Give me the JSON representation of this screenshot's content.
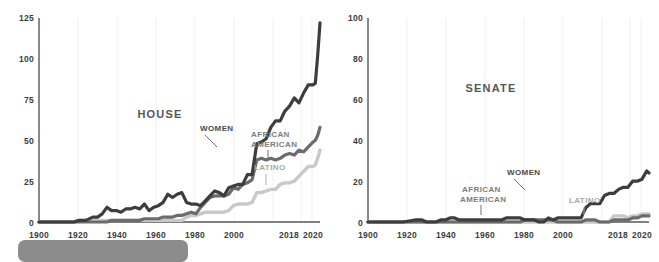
{
  "figure": {
    "background": "#ffffff",
    "caption_bar": {
      "name": "caption-placeholder-bar",
      "color": "#8c8c8c"
    }
  },
  "colors": {
    "women": "#3d3d3d",
    "african_american": "#6b6b6b",
    "latino": "#c9c9c9",
    "axis": "#575757",
    "grid": "#f1f1f1",
    "title": "#565656"
  },
  "chart_data": [
    {
      "type": "line",
      "title": "HOUSE",
      "xlabel": "",
      "ylabel": "",
      "xlim": [
        1900,
        2020
      ],
      "ylim": [
        0,
        125
      ],
      "yticks": [
        0,
        25,
        50,
        75,
        100,
        125
      ],
      "ytick_labels": [
        "0",
        "25",
        "50",
        "75",
        "100",
        "125"
      ],
      "xticks": [
        1900,
        1920,
        1940,
        1960,
        1980,
        2000,
        2018,
        2020
      ],
      "xtick_labels": [
        "1900",
        "1920",
        "1940",
        "1960",
        "1980",
        "2000",
        "2018",
        "2020"
      ],
      "grid": "vertical",
      "legend": "inline-annotations",
      "x": [
        1900,
        1905,
        1910,
        1915,
        1917,
        1920,
        1923,
        1925,
        1927,
        1929,
        1931,
        1933,
        1935,
        1937,
        1939,
        1941,
        1943,
        1945,
        1947,
        1949,
        1951,
        1953,
        1955,
        1957,
        1959,
        1961,
        1963,
        1965,
        1967,
        1969,
        1971,
        1973,
        1975,
        1977,
        1979,
        1981,
        1983,
        1985,
        1987,
        1989,
        1991,
        1993,
        1995,
        1997,
        1999,
        2001,
        2003,
        2005,
        2007,
        2009,
        2011,
        2013,
        2015,
        2017,
        2018,
        2019,
        2020
      ],
      "series": [
        {
          "name": "WOMEN",
          "color": "#3d3d3d",
          "values": [
            0,
            0,
            0,
            0,
            1,
            1,
            3,
            3,
            5,
            9,
            7,
            7,
            6,
            8,
            8,
            9,
            8,
            11,
            7,
            9,
            10,
            12,
            17,
            15,
            17,
            18,
            12,
            11,
            11,
            10,
            13,
            16,
            19,
            18,
            16,
            21,
            22,
            23,
            23,
            29,
            29,
            48,
            49,
            51,
            58,
            62,
            62,
            68,
            71,
            76,
            73,
            79,
            84,
            84,
            85,
            102,
            122
          ]
        },
        {
          "name": "AFRICAN AMERICAN",
          "color": "#6b6b6b",
          "values": [
            0,
            0,
            0,
            0,
            0,
            0,
            0,
            0,
            0,
            0,
            1,
            1,
            1,
            1,
            1,
            1,
            1,
            2,
            2,
            2,
            2,
            3,
            3,
            3,
            4,
            4,
            5,
            6,
            5,
            9,
            12,
            15,
            16,
            16,
            16,
            17,
            21,
            20,
            23,
            24,
            26,
            38,
            39,
            38,
            39,
            38,
            39,
            41,
            42,
            41,
            44,
            43,
            46,
            49,
            50,
            53,
            58
          ]
        },
        {
          "name": "LATINO",
          "color": "#c9c9c9",
          "values": [
            0,
            0,
            0,
            0,
            1,
            1,
            1,
            1,
            1,
            1,
            1,
            1,
            1,
            1,
            1,
            1,
            1,
            1,
            1,
            1,
            1,
            1,
            1,
            1,
            1,
            1,
            3,
            4,
            4,
            5,
            6,
            6,
            6,
            6,
            6,
            7,
            10,
            11,
            11,
            11,
            12,
            18,
            18,
            19,
            20,
            20,
            23,
            24,
            24,
            25,
            28,
            31,
            34,
            34,
            35,
            39,
            44
          ]
        }
      ],
      "annotations": [
        {
          "label": "WOMEN",
          "series": "women"
        },
        {
          "label": "AFRICAN AMERICAN",
          "series": "african_american"
        },
        {
          "label": "LATINO",
          "series": "latino"
        }
      ]
    },
    {
      "type": "line",
      "title": "SENATE",
      "xlabel": "",
      "ylabel": "",
      "xlim": [
        1900,
        2020
      ],
      "ylim": [
        0,
        100
      ],
      "yticks": [
        0,
        20,
        40,
        60,
        80,
        100
      ],
      "ytick_labels": [
        "0",
        "20",
        "40",
        "60",
        "80",
        "100"
      ],
      "xticks": [
        1900,
        1920,
        1940,
        1960,
        1980,
        2000,
        2018,
        2020
      ],
      "xtick_labels": [
        "1900",
        "1920",
        "1940",
        "1960",
        "1980",
        "2000",
        "2018",
        "2020"
      ],
      "grid": "vertical",
      "legend": "inline-annotations",
      "x": [
        1900,
        1905,
        1910,
        1915,
        1920,
        1923,
        1925,
        1929,
        1931,
        1933,
        1935,
        1937,
        1939,
        1941,
        1945,
        1949,
        1953,
        1957,
        1959,
        1961,
        1963,
        1965,
        1967,
        1969,
        1971,
        1973,
        1975,
        1977,
        1979,
        1981,
        1983,
        1985,
        1987,
        1989,
        1991,
        1993,
        1995,
        1997,
        1999,
        2001,
        2003,
        2005,
        2007,
        2009,
        2011,
        2013,
        2015,
        2017,
        2018,
        2019,
        2020
      ],
      "series": [
        {
          "name": "WOMEN",
          "color": "#3d3d3d",
          "values": [
            0,
            0,
            0,
            0,
            1,
            1,
            0,
            0,
            1,
            1,
            2,
            2,
            1,
            1,
            1,
            1,
            1,
            1,
            2,
            2,
            2,
            2,
            1,
            1,
            1,
            0,
            0,
            2,
            1,
            2,
            2,
            2,
            2,
            2,
            2,
            7,
            9,
            9,
            9,
            13,
            14,
            14,
            16,
            17,
            17,
            20,
            20,
            21,
            23,
            25,
            24
          ]
        },
        {
          "name": "AFRICAN AMERICAN",
          "color": "#6b6b6b",
          "values": [
            0,
            0,
            0,
            0,
            0,
            0,
            0,
            0,
            0,
            0,
            0,
            0,
            0,
            0,
            0,
            0,
            0,
            0,
            0,
            0,
            0,
            0,
            1,
            1,
            1,
            1,
            1,
            1,
            1,
            0,
            0,
            0,
            0,
            0,
            0,
            1,
            1,
            1,
            0,
            0,
            0,
            1,
            1,
            1,
            1,
            2,
            2,
            3,
            3,
            3,
            3
          ]
        },
        {
          "name": "LATINO",
          "color": "#c9c9c9",
          "values": [
            0,
            0,
            0,
            0,
            0,
            0,
            0,
            0,
            0,
            0,
            0,
            0,
            0,
            0,
            0,
            0,
            0,
            0,
            0,
            0,
            0,
            0,
            0,
            0,
            0,
            0,
            0,
            0,
            0,
            0,
            0,
            0,
            0,
            0,
            0,
            0,
            0,
            0,
            0,
            0,
            0,
            3,
            3,
            3,
            2,
            3,
            3,
            4,
            4,
            4,
            4
          ]
        }
      ],
      "annotations": [
        {
          "label": "WOMEN",
          "series": "women"
        },
        {
          "label": "AFRICAN AMERICAN",
          "series": "african_american"
        },
        {
          "label": "LATINO",
          "series": "latino"
        }
      ]
    }
  ]
}
